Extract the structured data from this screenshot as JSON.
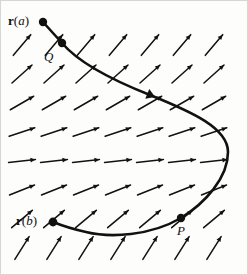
{
  "figure": {
    "type": "vector-field-with-oriented-curve",
    "width": 248,
    "height": 275,
    "background_color": "#fdfdfb",
    "ink_color": "#111111",
    "border_color": "#d8d6d0"
  },
  "labels": {
    "r_a": {
      "prefix": "r",
      "open": "(",
      "var": "a",
      "close": ")",
      "full": "r(a)"
    },
    "r_b": {
      "prefix": "r",
      "open": "(",
      "var": "b",
      "close": ")",
      "full": "r(b)"
    },
    "q": "Q",
    "p": "P"
  },
  "points": [
    {
      "name": "r_a",
      "label": "r(a)",
      "x": 43,
      "y": 22,
      "radius": 4.2
    },
    {
      "name": "q",
      "label": "Q",
      "x": 62,
      "y": 43,
      "radius": 4.2
    },
    {
      "name": "p",
      "label": "P",
      "x": 181,
      "y": 218,
      "radius": 4.2
    },
    {
      "name": "r_b",
      "label": "r(b)",
      "x": 53,
      "y": 222,
      "radius": 4.4
    }
  ],
  "curve": {
    "name": "oriented-path",
    "stroke_width": 2.6,
    "direction": "from r(a) through Q, right and down past P, to r(b)",
    "path": "M 43 22 L 62 43 C 78 62 112 80 150 95 C 192 112 228 128 228 152 C 228 178 205 203 181 218 C 150 236 110 238 86 232 C 68 228 58 224 53 222",
    "arrowhead": {
      "x": 150,
      "y": 95,
      "angle_deg": 22,
      "size": 10
    }
  },
  "vector_field": {
    "description": "grid of uniform arrows rotating from steeply up-right at top and bottom to nearly horizontal at mid-height",
    "columns": 7,
    "rows": 8,
    "x_start": 22,
    "x_step": 32,
    "y_start": 45,
    "y_step": 29,
    "arrow_length": 27,
    "stroke_width": 1.5,
    "head_size": 5.5,
    "row_angles_deg": [
      -50,
      -42,
      -30,
      -18,
      -6,
      -22,
      -40,
      -58
    ]
  }
}
